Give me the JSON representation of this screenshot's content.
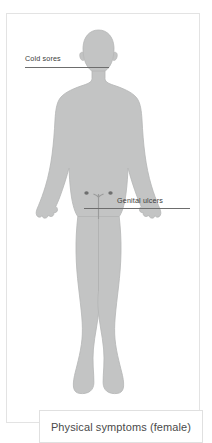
{
  "panel": {
    "border_color": "#e3e3e3",
    "background": "#ffffff"
  },
  "figure": {
    "name": "female-body-silhouette",
    "view": "anterior",
    "fill_color": "#c3c4c4",
    "stroke_color": "#b4b5b5"
  },
  "annotations": [
    {
      "id": "cold-sores",
      "label": "Cold sores",
      "target_region": "mouth",
      "line_color": "#6d6d6d",
      "text_color": "#3b3b3b"
    },
    {
      "id": "genital-ulcers",
      "label": "Genital ulcers",
      "target_region": "pelvis",
      "line_color": "#6d6d6d",
      "text_color": "#3b3b3b"
    }
  ],
  "lesions": [
    {
      "name": "lesion-mark-left",
      "region": "pelvis",
      "color": "#6e6f6f"
    },
    {
      "name": "lesion-mark-right",
      "region": "pelvis",
      "color": "#6e6f6f"
    }
  ],
  "caption": {
    "text": "Physical symptoms (female)",
    "border_color": "#e0e0e0",
    "text_color": "#4a4a4a"
  }
}
